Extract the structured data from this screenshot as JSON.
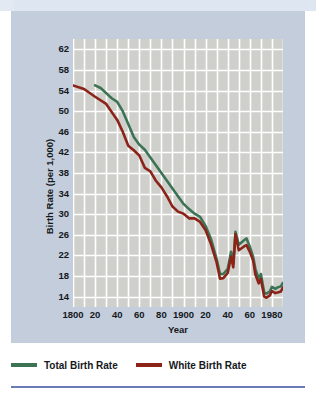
{
  "figure": {
    "background_color": "#ffffff",
    "panel_color": "#c3cddb",
    "plot_color": "#cfcfcb",
    "grid_color": "#ffffff",
    "rule_color": "#6b7bb5"
  },
  "axis": {
    "x_title": "Year",
    "y_title": "Birth Rate (per 1,000)"
  },
  "legend": {
    "items": [
      {
        "label": "Total Birth Rate",
        "color": "#3d7355"
      },
      {
        "label": "White Birth Rate",
        "color": "#8b2318"
      }
    ]
  },
  "chart_data": {
    "type": "line",
    "title": "",
    "xlabel": "Year",
    "ylabel": "Birth Rate (per 1,000)",
    "xlim": [
      1800,
      1990
    ],
    "ylim": [
      12,
      64
    ],
    "yticks": [
      14,
      18,
      22,
      26,
      30,
      34,
      38,
      42,
      46,
      50,
      54,
      58,
      62
    ],
    "xticks": [
      1800,
      1820,
      1840,
      1860,
      1880,
      1900,
      1920,
      1940,
      1960,
      1980
    ],
    "xticklabels": [
      "1800",
      "20",
      "40",
      "60",
      "80",
      "1900",
      "20",
      "40",
      "60",
      "1980"
    ],
    "grid": true,
    "x_gridlines": [
      1800,
      1810,
      1820,
      1830,
      1840,
      1850,
      1860,
      1870,
      1880,
      1890,
      1900,
      1910,
      1920,
      1930,
      1940,
      1950,
      1960,
      1970,
      1980,
      1990
    ],
    "legend_position": "below",
    "series": [
      {
        "name": "Total Birth Rate",
        "color": "#3d7355",
        "x": [
          1820,
          1825,
          1830,
          1835,
          1840,
          1845,
          1850,
          1855,
          1860,
          1865,
          1870,
          1875,
          1880,
          1885,
          1890,
          1895,
          1900,
          1905,
          1910,
          1915,
          1920,
          1925,
          1930,
          1933,
          1936,
          1940,
          1943,
          1945,
          1947,
          1950,
          1955,
          1957,
          1960,
          1963,
          1965,
          1968,
          1970,
          1973,
          1975,
          1978,
          1980,
          1983,
          1985,
          1988,
          1990
        ],
        "y": [
          55.0,
          54.5,
          53.5,
          52.5,
          51.8,
          50.0,
          47.5,
          45.0,
          43.5,
          42.5,
          41.0,
          39.5,
          38.0,
          36.5,
          35.0,
          33.5,
          32.0,
          31.0,
          30.1,
          29.5,
          27.7,
          25.1,
          21.3,
          18.4,
          18.4,
          19.4,
          22.7,
          20.4,
          26.6,
          24.1,
          25.0,
          25.3,
          23.7,
          21.7,
          19.4,
          17.5,
          18.4,
          14.8,
          14.6,
          15.0,
          15.9,
          15.5,
          15.8,
          16.0,
          16.7
        ]
      },
      {
        "name": "White Birth Rate",
        "color": "#8b2318",
        "x": [
          1800,
          1810,
          1820,
          1830,
          1840,
          1845,
          1850,
          1855,
          1860,
          1865,
          1870,
          1875,
          1880,
          1885,
          1890,
          1895,
          1900,
          1905,
          1910,
          1915,
          1920,
          1925,
          1930,
          1933,
          1936,
          1940,
          1943,
          1945,
          1947,
          1950,
          1955,
          1957,
          1960,
          1963,
          1965,
          1968,
          1970,
          1973,
          1975,
          1978,
          1980,
          1983,
          1985,
          1988,
          1990
        ],
        "y": [
          55.0,
          54.3,
          52.8,
          51.4,
          48.3,
          46.0,
          43.3,
          42.4,
          41.4,
          39.0,
          38.3,
          36.5,
          35.2,
          33.5,
          31.5,
          30.5,
          30.1,
          29.2,
          29.2,
          28.5,
          26.9,
          24.1,
          20.6,
          17.5,
          17.6,
          18.6,
          21.8,
          19.7,
          26.1,
          23.0,
          23.8,
          24.0,
          22.7,
          21.0,
          18.3,
          16.6,
          17.4,
          14.0,
          13.8,
          14.2,
          15.1,
          14.7,
          14.8,
          15.0,
          15.8
        ]
      }
    ]
  }
}
